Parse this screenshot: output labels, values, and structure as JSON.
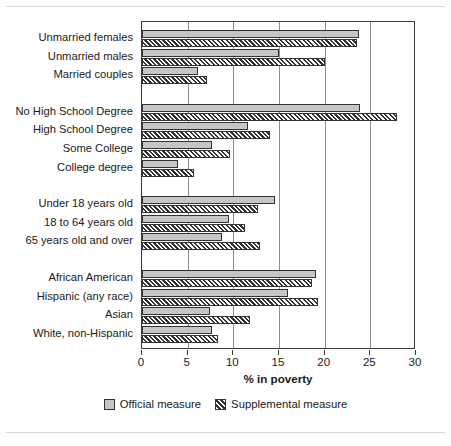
{
  "chart_data": {
    "type": "bar",
    "orientation": "horizontal",
    "title": "",
    "xlabel": "% in poverty",
    "ylabel": "",
    "xlim": [
      0,
      30
    ],
    "xticks": [
      0,
      5,
      10,
      15,
      20,
      25,
      30
    ],
    "xticklabels": [
      "0",
      "5",
      "10",
      "15",
      "20",
      "25",
      "30"
    ],
    "grid": "vertical",
    "legend_position": "below-axes",
    "categories": [
      "Unmarried females",
      "Unmarried males",
      "Married couples",
      "No High School Degree",
      "High School Degree",
      "Some College",
      "College degree",
      "Under 18 years old",
      "18 to 64 years old",
      "65 years old and over",
      "African American",
      "Hispanic (any race)",
      "Asian",
      "White, non-Hispanic"
    ],
    "groups": [
      {
        "name": "family-type",
        "categories": [
          "Unmarried females",
          "Unmarried males",
          "Married couples"
        ]
      },
      {
        "name": "education",
        "categories": [
          "No High School Degree",
          "High School Degree",
          "Some College",
          "College degree"
        ]
      },
      {
        "name": "age",
        "categories": [
          "Under 18 years old",
          "18 to 64 years old",
          "65 years old and over"
        ]
      },
      {
        "name": "race-ethnicity",
        "categories": [
          "African American",
          "Hispanic (any race)",
          "Asian",
          "White, non-Hispanic"
        ]
      }
    ],
    "series": [
      {
        "name": "Official measure",
        "values": [
          23.8,
          15.0,
          6.1,
          23.9,
          11.6,
          7.7,
          3.9,
          14.6,
          9.5,
          8.8,
          19.0,
          16.0,
          7.4,
          7.7
        ]
      },
      {
        "name": "Supplemental measure",
        "values": [
          23.5,
          20.0,
          7.1,
          27.9,
          14.0,
          9.6,
          5.7,
          12.7,
          11.3,
          12.9,
          18.6,
          19.3,
          11.8,
          8.3
        ]
      }
    ]
  },
  "legend": {
    "items": [
      {
        "label": "Official measure",
        "style": "solid-gray",
        "color": "#c6c6c6"
      },
      {
        "label": "Supplemental measure",
        "style": "diagonal-hatch",
        "color": "#333333"
      }
    ]
  },
  "axis": {
    "title": "% in poverty"
  },
  "colors": {
    "official_fill": "#c6c6c6",
    "bar_edge": "#333333",
    "gridline": "#8d8d8d",
    "axis": "#3a3a3a",
    "text": "#1a1a1a",
    "frame_rule": "#d8d8d8",
    "background": "#ffffff"
  }
}
